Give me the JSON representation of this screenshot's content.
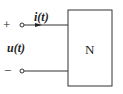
{
  "diagram": {
    "type": "one-port network",
    "network_label": "N",
    "current_label": "i(t)",
    "voltage_label": "u(t)",
    "plus_terminal": "+",
    "minus_terminal": "−",
    "line_color": "#333333"
  }
}
